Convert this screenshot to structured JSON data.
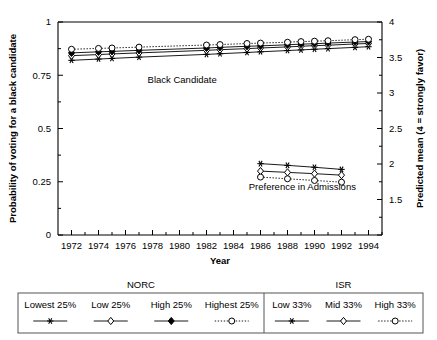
{
  "chart_data": {
    "type": "line",
    "title": "",
    "xlabel": "Year",
    "ylabel": "Probability of voting for a black candidate",
    "ylabel_right": "Predicted mean (4 = strongly favor)",
    "xlim": [
      1971,
      1995
    ],
    "ylim": [
      0,
      1
    ],
    "ylim_right": [
      1,
      4
    ],
    "grid": false,
    "xticks": [
      1972,
      1974,
      1976,
      1978,
      1980,
      1982,
      1984,
      1986,
      1988,
      1990,
      1992,
      1994
    ],
    "xtick_labels": [
      "1972",
      "1974",
      "1976",
      "1978",
      "1980",
      "1982",
      "1984",
      "1986",
      "1988",
      "1990",
      "1992",
      "1994"
    ],
    "yticks": [
      0,
      0.25,
      0.5,
      0.75,
      1
    ],
    "ytick_labels": [
      "0",
      "0.25",
      "0.5",
      "0.75",
      "1"
    ],
    "yticks_right": [
      1,
      1.5,
      2,
      2.5,
      3,
      3.5,
      4
    ],
    "ytick_labels_right": [
      "",
      "1.5",
      "2",
      "2.5",
      "3",
      "3.5",
      "4"
    ],
    "annotations": [
      {
        "text": "Black Candidate",
        "x": 1980.2,
        "y": 0.715
      },
      {
        "text": "Preference in Admissions",
        "x": 1989.1,
        "y": 0.21
      }
    ],
    "legend_position": "below-plot",
    "series": [
      {
        "name": "Lowest 25%",
        "group": "NORC",
        "marker": "asterisk",
        "linestyle": "solid",
        "panel": "Black Candidate",
        "x": [
          1972,
          1974,
          1975,
          1977,
          1982,
          1983,
          1985,
          1986,
          1988,
          1989,
          1990,
          1991,
          1993,
          1994
        ],
        "y": [
          0.82,
          0.826,
          0.829,
          0.835,
          0.848,
          0.851,
          0.857,
          0.86,
          0.866,
          0.869,
          0.872,
          0.875,
          0.881,
          0.884
        ]
      },
      {
        "name": "Low 25%",
        "group": "NORC",
        "marker": "open-diamond",
        "linestyle": "solid",
        "panel": "Black Candidate",
        "x": [
          1972,
          1974,
          1975,
          1977,
          1982,
          1983,
          1985,
          1986,
          1988,
          1989,
          1990,
          1991,
          1993,
          1994
        ],
        "y": [
          0.842,
          0.847,
          0.85,
          0.855,
          0.867,
          0.87,
          0.875,
          0.878,
          0.883,
          0.886,
          0.889,
          0.891,
          0.897,
          0.899
        ]
      },
      {
        "name": "High 25%",
        "group": "NORC",
        "marker": "filled-diamond",
        "linestyle": "solid",
        "panel": "Black Candidate",
        "x": [
          1972,
          1974,
          1975,
          1977,
          1982,
          1983,
          1985,
          1986,
          1988,
          1989,
          1990,
          1991,
          1993,
          1994
        ],
        "y": [
          0.855,
          0.86,
          0.862,
          0.867,
          0.878,
          0.881,
          0.886,
          0.888,
          0.893,
          0.896,
          0.898,
          0.901,
          0.906,
          0.908
        ]
      },
      {
        "name": "Highest 25%",
        "group": "NORC",
        "marker": "open-circle",
        "linestyle": "dotted",
        "panel": "Black Candidate",
        "x": [
          1972,
          1974,
          1975,
          1977,
          1982,
          1983,
          1985,
          1986,
          1988,
          1989,
          1990,
          1991,
          1993,
          1994
        ],
        "y": [
          0.872,
          0.876,
          0.878,
          0.882,
          0.892,
          0.894,
          0.899,
          0.901,
          0.905,
          0.908,
          0.91,
          0.912,
          0.917,
          0.919
        ]
      },
      {
        "name": "Low 33%",
        "group": "ISR",
        "marker": "asterisk",
        "linestyle": "solid",
        "panel": "Preference in Admissions",
        "x": [
          1986,
          1988,
          1990,
          1992
        ],
        "y": [
          0.335,
          0.327,
          0.318,
          0.308
        ]
      },
      {
        "name": "Mid 33%",
        "group": "ISR",
        "marker": "open-diamond",
        "linestyle": "solid",
        "panel": "Preference in Admissions",
        "x": [
          1986,
          1988,
          1990,
          1992
        ],
        "y": [
          0.3,
          0.294,
          0.288,
          0.281
        ]
      },
      {
        "name": "High 33%",
        "group": "ISR",
        "marker": "open-circle",
        "linestyle": "dotted",
        "panel": "Preference in Admissions",
        "x": [
          1986,
          1988,
          1990,
          1992
        ],
        "y": [
          0.272,
          0.264,
          0.256,
          0.248
        ]
      }
    ]
  },
  "legend": {
    "groups": [
      {
        "name": "NORC",
        "entries": [
          {
            "label": "Lowest 25%",
            "marker": "asterisk",
            "linestyle": "solid"
          },
          {
            "label": "Low 25%",
            "marker": "open-diamond",
            "linestyle": "solid"
          },
          {
            "label": "High 25%",
            "marker": "filled-diamond",
            "linestyle": "solid"
          },
          {
            "label": "Highest 25%",
            "marker": "open-circle",
            "linestyle": "dotted"
          }
        ]
      },
      {
        "name": "ISR",
        "entries": [
          {
            "label": "Low 33%",
            "marker": "asterisk",
            "linestyle": "solid"
          },
          {
            "label": "Mid 33%",
            "marker": "open-diamond",
            "linestyle": "solid"
          },
          {
            "label": "High 33%",
            "marker": "open-circle",
            "linestyle": "dotted"
          }
        ]
      }
    ]
  },
  "colors": {
    "ink": "#000000",
    "legend_border": "#555555",
    "background": "#ffffff"
  }
}
